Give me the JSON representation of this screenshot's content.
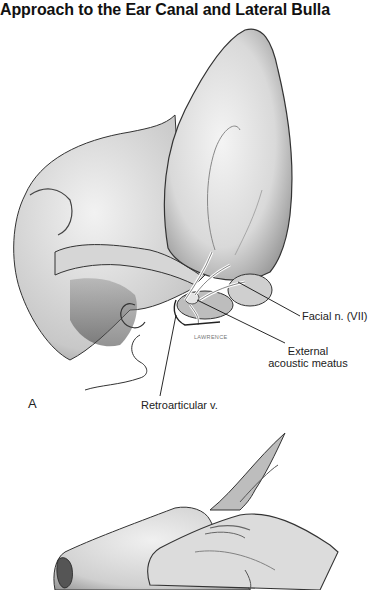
{
  "page": {
    "title": "Approach to the Ear Canal and Lateral Bulla"
  },
  "figure_a": {
    "panel_label": "A",
    "artist_signature": "LAWRENCE",
    "labels": {
      "facial_nerve": "Facial n. (VII)",
      "external_acoustic_meatus_line1": "External",
      "external_acoustic_meatus_line2": "acoustic meatus",
      "retroarticular_vein": "Retroarticular v."
    }
  },
  "figure_b": {
    "description": "Illustration of hand grasping ear pinna (partial, cropped)"
  }
}
